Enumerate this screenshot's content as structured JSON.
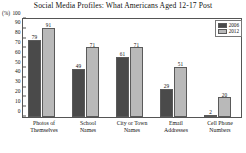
{
  "chart_data": {
    "type": "bar",
    "title": "Social Media Profiles: What Americans Aged 12-17 Post",
    "xlabel": "",
    "ylabel": "(%)",
    "ylim": [
      0,
      100
    ],
    "yticks": [
      0,
      10,
      20,
      30,
      40,
      50,
      60,
      70,
      80,
      90,
      100
    ],
    "grid": false,
    "legend_position": "top-right",
    "categories": [
      "Photos of Themselves",
      "School Names",
      "City or Town Names",
      "Email Addresses",
      "Cell Phone Numbers"
    ],
    "category_lines": [
      [
        "Photos of",
        "Themselves"
      ],
      [
        "School",
        "Names"
      ],
      [
        "City or Town",
        "Names"
      ],
      [
        "Email",
        "Addresses"
      ],
      [
        "Cell Phone",
        "Numbers"
      ]
    ],
    "series": [
      {
        "name": "2006",
        "color": "#4a4a4a",
        "values": [
          79,
          49,
          61,
          29,
          2
        ]
      },
      {
        "name": "2012",
        "color": "#b9b9b9",
        "values": [
          91,
          71,
          71,
          51,
          20
        ]
      }
    ]
  }
}
